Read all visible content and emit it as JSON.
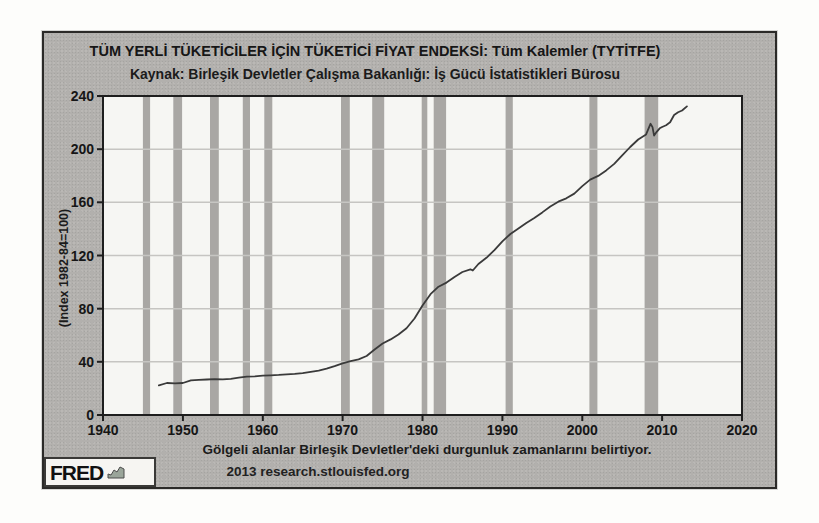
{
  "footer": {
    "credit": "2013 research.stlouisfed.org"
  },
  "logo": {
    "text": "FRED",
    "icon": "area-sparkline-icon"
  },
  "colors": {
    "page_bg": "#fdfdfb",
    "box_bg": "#b2b0ad",
    "box_border": "#2b2a28",
    "plot_bg": "#f6f6f3",
    "recession_band": "#a9a7a4",
    "gridline": "#c6c5c2",
    "frame": "#1e1e1e",
    "line": "#3a3a3a",
    "text": "#161616"
  },
  "chart_data": {
    "type": "line",
    "title": "TÜM YERLİ TÜKETİCİLER İÇİN TÜKETİCİ FİYAT ENDEKSİ: Tüm Kalemler (TYTİTFE)",
    "subtitle": "Kaynak: Birleşik Devletler Çalışma Bakanlığı: İş Gücü İstatistikleri Bürosu",
    "xlabel": "",
    "ylabel": "(Index 1982-84=100)",
    "note": "Gölgeli alanlar Birleşik Devletler'deki durgunluk zamanlarını belirtiyor.",
    "xlim": [
      1940,
      2020
    ],
    "ylim": [
      0,
      240
    ],
    "x_ticks": [
      1940,
      1950,
      1960,
      1970,
      1980,
      1990,
      2000,
      2010,
      2020
    ],
    "y_ticks": [
      0,
      40,
      80,
      120,
      160,
      200,
      240
    ],
    "grid": "horizontal",
    "legend": "none",
    "recession_bands": [
      [
        1945.0,
        1945.9
      ],
      [
        1948.8,
        1949.9
      ],
      [
        1953.4,
        1954.5
      ],
      [
        1957.5,
        1958.4
      ],
      [
        1960.2,
        1961.2
      ],
      [
        1969.8,
        1970.9
      ],
      [
        1973.7,
        1975.2
      ],
      [
        1979.9,
        1980.6
      ],
      [
        1981.4,
        1982.95
      ],
      [
        1990.4,
        1991.3
      ],
      [
        2000.9,
        2001.9
      ],
      [
        2007.8,
        2009.5
      ]
    ],
    "series": [
      {
        "name": "Tüketici Fiyat Endeksi: Tüm Kalemler (TYTİTFE)",
        "points": [
          [
            1947,
            22.3
          ],
          [
            1948,
            24.1
          ],
          [
            1949,
            23.8
          ],
          [
            1950,
            24.1
          ],
          [
            1951,
            26.0
          ],
          [
            1952,
            26.5
          ],
          [
            1953,
            26.7
          ],
          [
            1954,
            26.9
          ],
          [
            1955,
            26.8
          ],
          [
            1956,
            27.2
          ],
          [
            1957,
            28.1
          ],
          [
            1958,
            28.9
          ],
          [
            1959,
            29.1
          ],
          [
            1960,
            29.6
          ],
          [
            1961,
            29.9
          ],
          [
            1962,
            30.2
          ],
          [
            1963,
            30.6
          ],
          [
            1964,
            31.0
          ],
          [
            1965,
            31.5
          ],
          [
            1966,
            32.4
          ],
          [
            1967,
            33.4
          ],
          [
            1968,
            34.8
          ],
          [
            1969,
            36.7
          ],
          [
            1970,
            38.8
          ],
          [
            1971,
            40.5
          ],
          [
            1972,
            41.8
          ],
          [
            1973,
            44.4
          ],
          [
            1974,
            49.3
          ],
          [
            1975,
            53.8
          ],
          [
            1976,
            56.9
          ],
          [
            1977,
            60.6
          ],
          [
            1978,
            65.2
          ],
          [
            1979,
            72.6
          ],
          [
            1980,
            82.4
          ],
          [
            1981,
            90.9
          ],
          [
            1982,
            96.5
          ],
          [
            1983,
            99.6
          ],
          [
            1984,
            103.9
          ],
          [
            1985,
            107.6
          ],
          [
            1986,
            109.6
          ],
          [
            1986.3,
            108.7
          ],
          [
            1987,
            113.6
          ],
          [
            1988,
            118.3
          ],
          [
            1989,
            124.0
          ],
          [
            1990,
            130.7
          ],
          [
            1991,
            136.2
          ],
          [
            1992,
            140.3
          ],
          [
            1993,
            144.5
          ],
          [
            1994,
            148.2
          ],
          [
            1995,
            152.4
          ],
          [
            1996,
            156.9
          ],
          [
            1997,
            160.5
          ],
          [
            1998,
            163.0
          ],
          [
            1999,
            166.6
          ],
          [
            2000,
            172.2
          ],
          [
            2001,
            177.1
          ],
          [
            2002,
            179.9
          ],
          [
            2003,
            184.0
          ],
          [
            2004,
            188.9
          ],
          [
            2005,
            195.3
          ],
          [
            2006,
            201.6
          ],
          [
            2007,
            207.3
          ],
          [
            2008.0,
            211.1
          ],
          [
            2008.55,
            219.1
          ],
          [
            2008.8,
            216.6
          ],
          [
            2009.0,
            210.2
          ],
          [
            2009.35,
            213.2
          ],
          [
            2009.7,
            215.7
          ],
          [
            2010.0,
            216.7
          ],
          [
            2010.5,
            218.0
          ],
          [
            2011.0,
            220.2
          ],
          [
            2011.5,
            225.7
          ],
          [
            2012.0,
            227.7
          ],
          [
            2012.5,
            229.1
          ],
          [
            2013.1,
            232.2
          ]
        ]
      }
    ]
  }
}
